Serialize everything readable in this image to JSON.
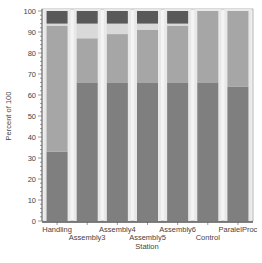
{
  "chart_data": {
    "type": "bar",
    "stacked": true,
    "title": "",
    "xlabel": "Station",
    "ylabel": "Percent of 100",
    "ylim": [
      0,
      100
    ],
    "yticks": [
      0,
      10,
      20,
      30,
      40,
      50,
      60,
      70,
      80,
      90,
      100
    ],
    "grid": false,
    "legend": null,
    "categories": [
      "Handling",
      "Assembly3",
      "Assembly4",
      "Assembly5",
      "Assembly6",
      "Control",
      "ParalelProc"
    ],
    "series": [
      {
        "name": "Segment 1",
        "color": "#7f7f7f",
        "values": [
          33,
          66,
          66,
          66,
          66,
          66,
          64
        ]
      },
      {
        "name": "Segment 2",
        "color": "#a6a6a6",
        "values": [
          60,
          21,
          23,
          25,
          27,
          34,
          36
        ]
      },
      {
        "name": "Segment 3",
        "color": "#d9d9d9",
        "values": [
          1,
          7,
          5,
          3,
          1,
          0,
          0
        ]
      },
      {
        "name": "Segment 4",
        "color": "#595959",
        "values": [
          6,
          6,
          6,
          6,
          6,
          0,
          0
        ]
      }
    ]
  },
  "colors": {
    "bar_background": "#e8e8e8",
    "axis": "#555555",
    "plot_border": "#888888"
  }
}
